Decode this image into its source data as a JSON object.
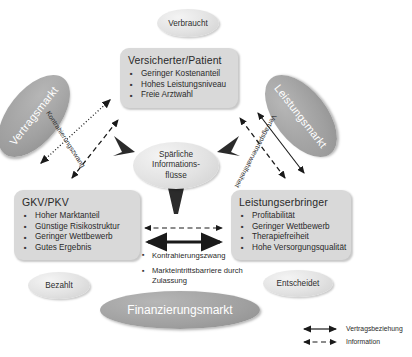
{
  "diagram": {
    "colors": {
      "box_fill": "#d9d9d9",
      "ellipse_light": "#e2e2e2",
      "ellipse_dark": "#a0a0a0",
      "line": "#1a1a1a",
      "text": "#2a2a2a",
      "text_inverse": "#ffffff"
    }
  },
  "boxes": {
    "versicherter": {
      "title": "Versicherter/Patient",
      "bullets": [
        "Geringer Kostenanteil",
        "Hohes Leistungsniveau",
        "Freie Arztwahl"
      ]
    },
    "gkvpkv": {
      "title": "GKV/PKV",
      "bullets": [
        "Hoher Marktanteil",
        "Günstige Risikostruktur",
        "Geringer Wettbewerb",
        "Gutes Ergebnis"
      ]
    },
    "leistungserbringer": {
      "title": "Leistungserbringer",
      "bullets": [
        "Profitabilität",
        "Geringer Wettbewerb",
        "Therapiefreiheit",
        "Hohe Versorgungsqualität"
      ]
    }
  },
  "ellipses": {
    "verbraucht": "Verbraucht",
    "bezahlt": "Bezahlt",
    "entscheidet": "Entscheidet",
    "center_line1": "Spärliche",
    "center_line2": "Informations-",
    "center_line3": "flüsse",
    "vertragsmarkt": "Vertragsmarkt",
    "leistungsmarkt": "Leistungsmarkt",
    "finanzierungsmarkt": "Finanzierungsmarkt"
  },
  "line_labels": {
    "kontrahierungszwang": "Kontrahierungszwang",
    "vertragspartnerwahlfreiheit": "Vertragspartnerwahlfreiheit"
  },
  "bottom_notes": [
    "Kontrahierungszwang",
    "Markteintrittsbarriere durch Zulassung"
  ],
  "legend": [
    {
      "symbol": "solid-double-arrow",
      "label": "Vertragsbeziehung"
    },
    {
      "symbol": "dashed-double-arrow",
      "label": "Information"
    }
  ]
}
